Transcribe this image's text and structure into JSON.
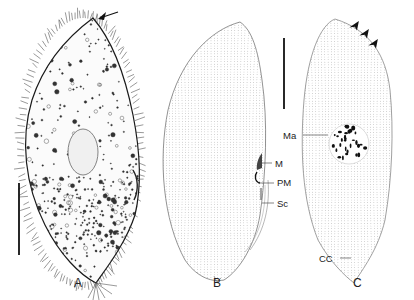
{
  "figure": {
    "panels": [
      {
        "id": "A",
        "label": "A",
        "description": "live specimen with cilia, cytoplasmic granules and contractile vacuole"
      },
      {
        "id": "B",
        "label": "B",
        "description": "ventral view ciliary pattern, oral structures"
      },
      {
        "id": "C",
        "label": "C",
        "description": "dorsal view ciliary pattern and macronucleus"
      }
    ],
    "annotations": {
      "M": "M",
      "PM": "PM",
      "Sc": "Sc",
      "Ma": "Ma",
      "CC": "CC"
    },
    "colors": {
      "ink": "#1a1a1a",
      "dots": "#777777",
      "background": "#ffffff"
    }
  }
}
